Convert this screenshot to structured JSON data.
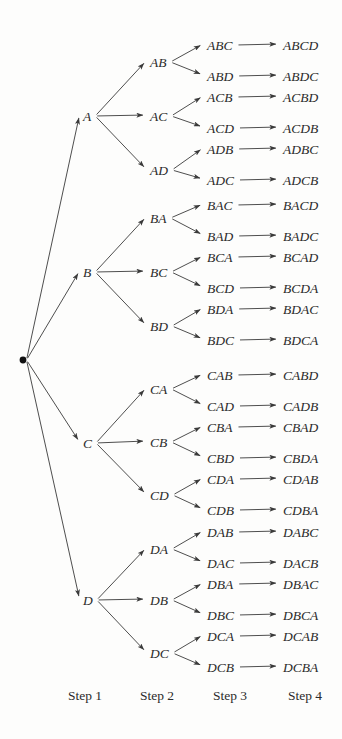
{
  "figure": {
    "type": "tree-diagram",
    "background_color": "#fdfdfc",
    "ink_color": "#2b2b2b",
    "root": {
      "name": "root-node",
      "label": "",
      "shape": "filled-dot",
      "x": 23,
      "y": 360,
      "radius": 3.4
    },
    "columns": [
      {
        "key": "step1",
        "label": "Step 1",
        "label_x": 85,
        "label_y": 700,
        "node_x": 83
      },
      {
        "key": "step2",
        "label": "Step 2",
        "label_x": 157,
        "label_y": 700,
        "node_x": 150
      },
      {
        "key": "step3",
        "label": "Step 3",
        "label_x": 230,
        "label_y": 700,
        "node_x": 207
      },
      {
        "key": "step4",
        "label": "Step 4",
        "label_x": 305,
        "label_y": 700,
        "node_x": 283
      }
    ],
    "level1_nodes": [
      {
        "id": "A",
        "label": "A",
        "x": 83,
        "y": 116
      },
      {
        "id": "B",
        "label": "B",
        "x": 83,
        "y": 272
      },
      {
        "id": "C",
        "label": "C",
        "x": 83,
        "y": 443
      },
      {
        "id": "D",
        "label": "D",
        "x": 83,
        "y": 600
      }
    ],
    "level2_nodes": [
      {
        "id": "AB",
        "label": "AB",
        "parent": "A",
        "x": 150,
        "y": 62
      },
      {
        "id": "AC",
        "label": "AC",
        "parent": "A",
        "x": 150,
        "y": 116
      },
      {
        "id": "AD",
        "label": "AD",
        "parent": "A",
        "x": 150,
        "y": 170
      },
      {
        "id": "BA",
        "label": "BA",
        "parent": "B",
        "x": 150,
        "y": 218
      },
      {
        "id": "BC",
        "label": "BC",
        "parent": "B",
        "x": 150,
        "y": 272
      },
      {
        "id": "BD",
        "label": "BD",
        "parent": "B",
        "x": 150,
        "y": 326
      },
      {
        "id": "CA",
        "label": "CA",
        "parent": "C",
        "x": 150,
        "y": 389
      },
      {
        "id": "CB",
        "label": "CB",
        "parent": "C",
        "x": 150,
        "y": 442
      },
      {
        "id": "CD",
        "label": "CD",
        "parent": "C",
        "x": 150,
        "y": 495
      },
      {
        "id": "DA",
        "label": "DA",
        "parent": "D",
        "x": 150,
        "y": 549
      },
      {
        "id": "DB",
        "label": "DB",
        "parent": "D",
        "x": 150,
        "y": 600
      },
      {
        "id": "DC",
        "label": "DC",
        "parent": "D",
        "x": 150,
        "y": 653
      }
    ],
    "level3_nodes": [
      {
        "id": "ABC",
        "label": "ABC",
        "parent": "AB",
        "x": 207,
        "y": 45
      },
      {
        "id": "ABD",
        "label": "ABD",
        "parent": "AB",
        "x": 207,
        "y": 76
      },
      {
        "id": "ACB",
        "label": "ACB",
        "parent": "AC",
        "x": 207,
        "y": 97
      },
      {
        "id": "ACD",
        "label": "ACD",
        "parent": "AC",
        "x": 207,
        "y": 128
      },
      {
        "id": "ADB",
        "label": "ADB",
        "parent": "AD",
        "x": 207,
        "y": 149
      },
      {
        "id": "ADC",
        "label": "ADC",
        "parent": "AD",
        "x": 207,
        "y": 180
      },
      {
        "id": "BAC",
        "label": "BAC",
        "parent": "BA",
        "x": 207,
        "y": 205
      },
      {
        "id": "BAD",
        "label": "BAD",
        "parent": "BA",
        "x": 207,
        "y": 236
      },
      {
        "id": "BCA",
        "label": "BCA",
        "parent": "BC",
        "x": 207,
        "y": 257
      },
      {
        "id": "BCD",
        "label": "BCD",
        "parent": "BC",
        "x": 207,
        "y": 288
      },
      {
        "id": "BDA",
        "label": "BDA",
        "parent": "BD",
        "x": 207,
        "y": 309
      },
      {
        "id": "BDC",
        "label": "BDC",
        "parent": "BD",
        "x": 207,
        "y": 340
      },
      {
        "id": "CAB",
        "label": "CAB",
        "parent": "CA",
        "x": 207,
        "y": 375
      },
      {
        "id": "CAD",
        "label": "CAD",
        "parent": "CA",
        "x": 207,
        "y": 406
      },
      {
        "id": "CBA",
        "label": "CBA",
        "parent": "CB",
        "x": 207,
        "y": 427
      },
      {
        "id": "CBD",
        "label": "CBD",
        "parent": "CB",
        "x": 207,
        "y": 458
      },
      {
        "id": "CDA",
        "label": "CDA",
        "parent": "CD",
        "x": 207,
        "y": 479
      },
      {
        "id": "CDB",
        "label": "CDB",
        "parent": "CD",
        "x": 207,
        "y": 510
      },
      {
        "id": "DAB",
        "label": "DAB",
        "parent": "DA",
        "x": 207,
        "y": 532
      },
      {
        "id": "DAC",
        "label": "DAC",
        "parent": "DA",
        "x": 207,
        "y": 563
      },
      {
        "id": "DBA",
        "label": "DBA",
        "parent": "DB",
        "x": 207,
        "y": 584
      },
      {
        "id": "DBC",
        "label": "DBC",
        "parent": "DB",
        "x": 207,
        "y": 615
      },
      {
        "id": "DCA",
        "label": "DCA",
        "parent": "DC",
        "x": 207,
        "y": 636
      },
      {
        "id": "DCB",
        "label": "DCB",
        "parent": "DC",
        "x": 207,
        "y": 667
      }
    ],
    "level4_nodes": [
      {
        "id": "ABCD",
        "label": "ABCD",
        "parent": "ABC",
        "x": 283,
        "y": 45
      },
      {
        "id": "ABDC",
        "label": "ABDC",
        "parent": "ABD",
        "x": 283,
        "y": 76
      },
      {
        "id": "ACBD",
        "label": "ACBD",
        "parent": "ACB",
        "x": 283,
        "y": 97
      },
      {
        "id": "ACDB",
        "label": "ACDB",
        "parent": "ACD",
        "x": 283,
        "y": 128
      },
      {
        "id": "ADBC",
        "label": "ADBC",
        "parent": "ADB",
        "x": 283,
        "y": 149
      },
      {
        "id": "ADCB",
        "label": "ADCB",
        "parent": "ADC",
        "x": 283,
        "y": 180
      },
      {
        "id": "BACD",
        "label": "BACD",
        "parent": "BAC",
        "x": 283,
        "y": 205
      },
      {
        "id": "BADC",
        "label": "BADC",
        "parent": "BAD",
        "x": 283,
        "y": 236
      },
      {
        "id": "BCAD",
        "label": "BCAD",
        "parent": "BCA",
        "x": 283,
        "y": 257
      },
      {
        "id": "BCDA",
        "label": "BCDA",
        "parent": "BCD",
        "x": 283,
        "y": 288
      },
      {
        "id": "BDAC",
        "label": "BDAC",
        "parent": "BDA",
        "x": 283,
        "y": 309
      },
      {
        "id": "BDCA",
        "label": "BDCA",
        "parent": "BDC",
        "x": 283,
        "y": 340
      },
      {
        "id": "CABD",
        "label": "CABD",
        "parent": "CAB",
        "x": 283,
        "y": 375
      },
      {
        "id": "CADB",
        "label": "CADB",
        "parent": "CAD",
        "x": 283,
        "y": 406
      },
      {
        "id": "CBAD",
        "label": "CBAD",
        "parent": "CBA",
        "x": 283,
        "y": 427
      },
      {
        "id": "CBDA",
        "label": "CBDA",
        "parent": "CBD",
        "x": 283,
        "y": 458
      },
      {
        "id": "CDAB",
        "label": "CDAB",
        "parent": "CDA",
        "x": 283,
        "y": 479
      },
      {
        "id": "CDBA",
        "label": "CDBA",
        "parent": "CDB",
        "x": 283,
        "y": 510
      },
      {
        "id": "DABC",
        "label": "DABC",
        "parent": "DAB",
        "x": 283,
        "y": 532
      },
      {
        "id": "DACB",
        "label": "DACB",
        "parent": "DAC",
        "x": 283,
        "y": 563
      },
      {
        "id": "DBAC",
        "label": "DBAC",
        "parent": "DBA",
        "x": 283,
        "y": 584
      },
      {
        "id": "DBCA",
        "label": "DBCA",
        "parent": "DBC",
        "x": 283,
        "y": 615
      },
      {
        "id": "DCAB",
        "label": "DCAB",
        "parent": "DCA",
        "x": 283,
        "y": 636
      },
      {
        "id": "DCBA",
        "label": "DCBA",
        "parent": "DCB",
        "x": 283,
        "y": 667
      }
    ]
  }
}
